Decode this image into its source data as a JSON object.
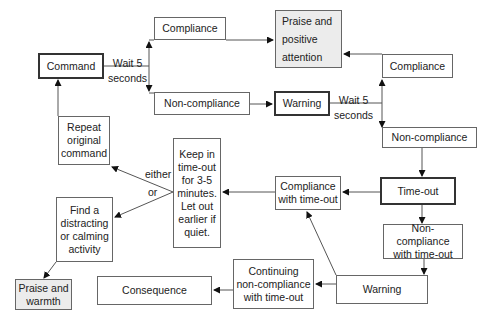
{
  "diagram": {
    "nodes": {
      "command": "Command",
      "compliance_top": "Compliance",
      "praise_positive": "Praise and\npositive\nattention",
      "noncompliance_left": "Non-compliance",
      "warning_top": "Warning",
      "compliance_right": "Compliance",
      "noncompliance_right": "Non-compliance",
      "timeout": "Time-out",
      "compliance_timeout": "Compliance\nwith time-out",
      "noncompliance_timeout": "Non-compliance\nwith time-out",
      "keep_in_timeout": "Keep in\ntime-out\nfor 3-5\nminutes.\nLet out\nearlier if\nquiet.",
      "repeat_command": "Repeat\noriginal\ncommand",
      "find_activity": "Find a\ndistracting\nor calming\nactivity",
      "praise_warmth": "Praise and\nwarmth",
      "warning_bottom": "Warning",
      "continuing_noncompliance": "Continuing\nnon-compliance\nwith time-out",
      "consequence": "Consequence"
    },
    "edge_labels": {
      "wait1": "Wait 5\nseconds",
      "wait2": "Wait 5\nseconds",
      "either": "either",
      "or": "or"
    }
  }
}
